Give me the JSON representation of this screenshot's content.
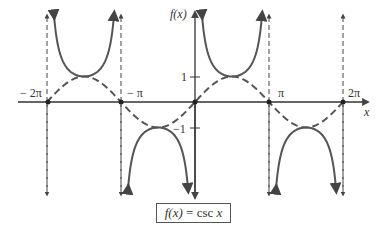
{
  "chart_data": {
    "type": "line",
    "title": "f(x) = csc x",
    "xlabel": "x",
    "ylabel": "f(x)",
    "x_ticks": [
      "-2π",
      "-π",
      "π",
      "2π"
    ],
    "y_ticks": [
      "1",
      "-1"
    ],
    "xlim": [
      -6.28,
      7.0
    ],
    "ylim": [
      -3.5,
      3.6
    ],
    "asymptotes_x": [
      "-2π",
      "-π",
      "0",
      "π",
      "2π"
    ],
    "series": [
      {
        "name": "csc x",
        "style": "solid",
        "description": "U-shaped branches with local minima at (−3π/2, 1) and (π/2, 1); inverted branches with local maxima at (−π/2, −1) and (3π/2, −1)"
      },
      {
        "name": "sin x (reference)",
        "style": "dashed",
        "description": "sine curve from −2π to 2π, zeros at −2π, −π, 0, π, 2π"
      }
    ],
    "grid": false,
    "legend": "none"
  },
  "labels": {
    "y_axis": "f(x)",
    "x_axis": "x",
    "neg_two_pi": "− 2π",
    "neg_pi": "− π",
    "pi": "π",
    "two_pi": "2π",
    "one": "1",
    "neg_one": "−1",
    "caption_lhs": "f(x)",
    "caption_eq": " = ",
    "caption_rhs": "csc ",
    "caption_var": "x"
  },
  "colors": {
    "curve": "#555555",
    "axis": "#333333"
  }
}
